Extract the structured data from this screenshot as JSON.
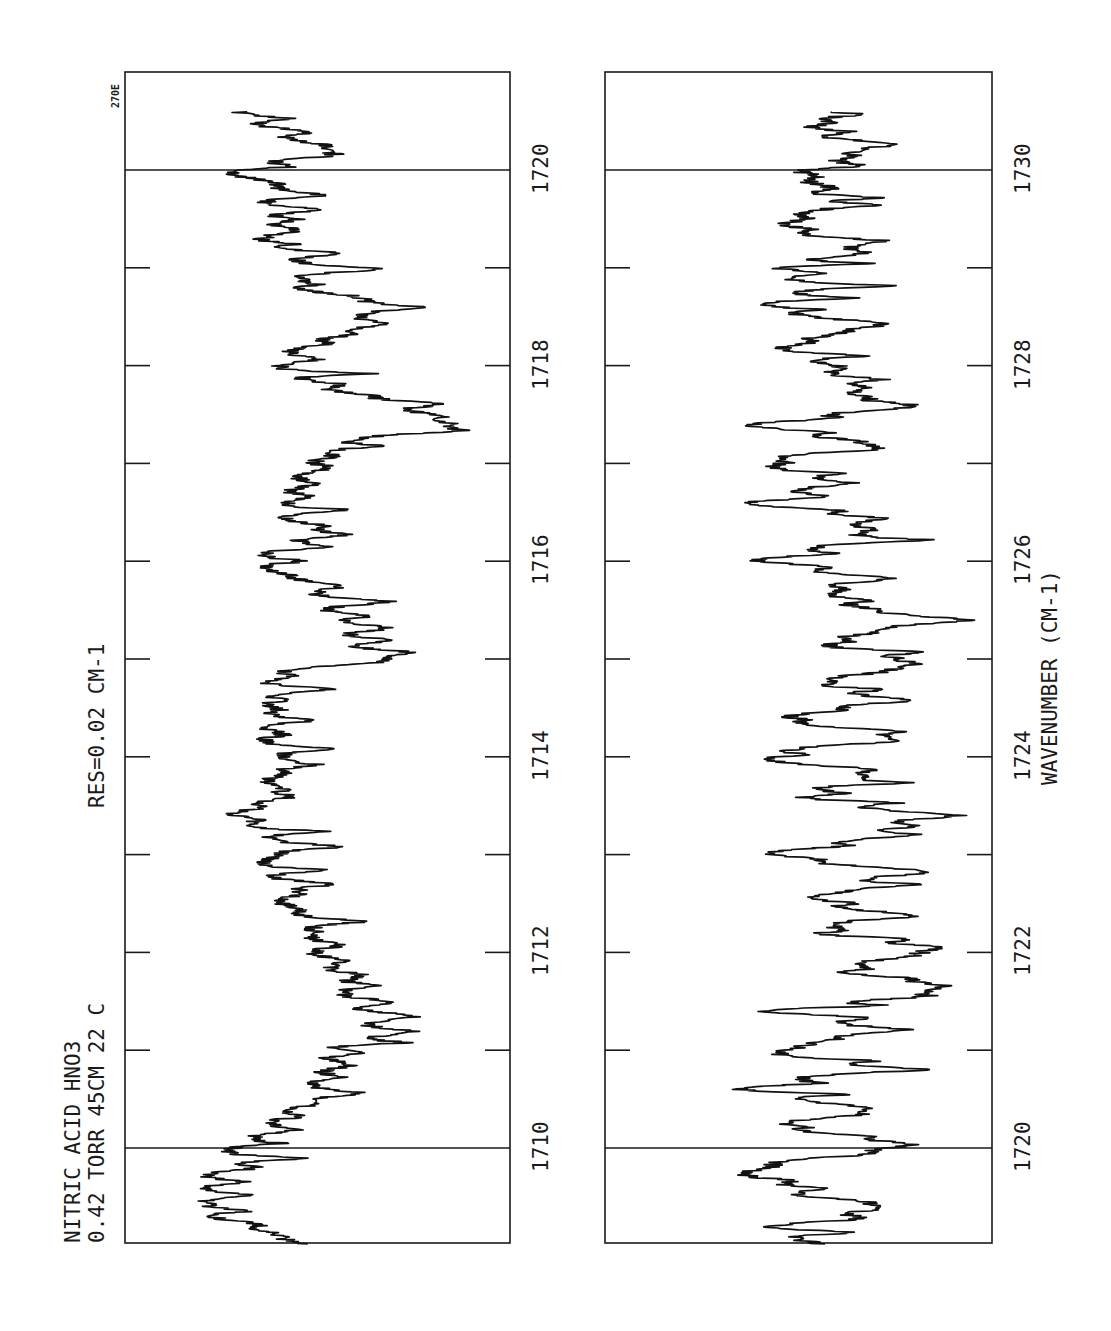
{
  "header": {
    "line1": "NITRIC ACID  HNO3",
    "line2": "0.42  TORR  45CM   22 C",
    "resolution": "RES=0.02 CM-1",
    "plate_code": "270E"
  },
  "colors": {
    "ink": "#111111",
    "paper": "#ffffff"
  },
  "chart_data": [
    {
      "type": "line",
      "title": "NITRIC ACID HNO3 — 0.42 TORR 45CM 22 C — RES=0.02 CM-1",
      "panel": "left",
      "orientation": "rotated 90° (wavenumber runs bottom-to-top, transmittance increases right-to-left)",
      "xlabel": "WAVENUMBER (CM-1)",
      "ylabel": "Transmittance (unlabeled)",
      "xlim": [
        1709.0,
        1720.95
      ],
      "ticks": [
        1710,
        1711,
        1712,
        1713,
        1714,
        1715,
        1716,
        1717,
        1718,
        1719,
        1720
      ],
      "tick_labels": [
        "1710",
        "1712",
        "1714",
        "1716",
        "1718",
        "1720"
      ],
      "label_positions": [
        1710,
        1712,
        1714,
        1716,
        1718,
        1720
      ],
      "reference_lines": [
        1710,
        1720
      ],
      "grid": false,
      "series": [
        {
          "name": "HNO3 spectrum 1709–1721 cm-1",
          "x": [
            1709.0,
            1709.2,
            1709.4,
            1709.6,
            1709.8,
            1710.0,
            1710.2,
            1710.4,
            1710.6,
            1710.8,
            1711.0,
            1711.2,
            1711.4,
            1711.6,
            1711.8,
            1712.0,
            1712.2,
            1712.4,
            1712.6,
            1712.8,
            1713.0,
            1713.2,
            1713.4,
            1713.6,
            1713.8,
            1714.0,
            1714.2,
            1714.4,
            1714.6,
            1714.8,
            1715.0,
            1715.2,
            1715.4,
            1715.6,
            1715.8,
            1716.0,
            1716.2,
            1716.4,
            1716.6,
            1716.8,
            1717.0,
            1717.2,
            1717.4,
            1717.6,
            1717.8,
            1718.0,
            1718.2,
            1718.4,
            1718.6,
            1718.8,
            1719.0,
            1719.2,
            1719.4,
            1719.6,
            1719.8,
            1720.0,
            1720.2,
            1720.4,
            1720.6
          ],
          "values": [
            0.8,
            0.84,
            0.82,
            0.83,
            0.8,
            0.78,
            0.7,
            0.64,
            0.6,
            0.58,
            0.56,
            0.48,
            0.52,
            0.5,
            0.55,
            0.58,
            0.62,
            0.66,
            0.7,
            0.72,
            0.74,
            0.7,
            0.76,
            0.72,
            0.7,
            0.66,
            0.74,
            0.7,
            0.72,
            0.76,
            0.5,
            0.62,
            0.6,
            0.58,
            0.66,
            0.76,
            0.7,
            0.64,
            0.62,
            0.66,
            0.64,
            0.55,
            0.2,
            0.42,
            0.6,
            0.66,
            0.62,
            0.58,
            0.4,
            0.64,
            0.58,
            0.7,
            0.74,
            0.76,
            0.66,
            0.8,
            0.62,
            0.7,
            0.72
          ],
          "note": "Approximate envelope of transmittance (1 = far left of frame, 0 = far right); strong absorption near 1717.4 and 1711.3"
        }
      ]
    },
    {
      "type": "line",
      "panel": "right",
      "orientation": "rotated 90° (wavenumber runs bottom-to-top, transmittance increases right-to-left)",
      "xlabel": "WAVENUMBER (CM-1)",
      "ylabel": "Transmittance (unlabeled)",
      "xlim": [
        1719.0,
        1730.95
      ],
      "ticks": [
        1720,
        1721,
        1722,
        1723,
        1724,
        1725,
        1726,
        1727,
        1728,
        1729,
        1730
      ],
      "tick_labels": [
        "1720",
        "1722",
        "1724",
        "1726",
        "1728",
        "1730"
      ],
      "label_positions": [
        1720,
        1722,
        1724,
        1726,
        1728,
        1730
      ],
      "reference_lines": [
        1720,
        1730
      ],
      "grid": false,
      "series": [
        {
          "name": "HNO3 spectrum 1719–1731 cm-1",
          "x": [
            1719.0,
            1719.2,
            1719.4,
            1719.6,
            1719.8,
            1720.0,
            1720.2,
            1720.4,
            1720.6,
            1720.8,
            1721.0,
            1721.2,
            1721.4,
            1721.6,
            1721.8,
            1722.0,
            1722.2,
            1722.4,
            1722.6,
            1722.8,
            1723.0,
            1723.2,
            1723.4,
            1723.6,
            1723.8,
            1724.0,
            1724.2,
            1724.4,
            1724.6,
            1724.8,
            1725.0,
            1725.2,
            1725.4,
            1725.6,
            1725.8,
            1726.0,
            1726.2,
            1726.4,
            1726.6,
            1726.8,
            1727.0,
            1727.2,
            1727.4,
            1727.6,
            1727.8,
            1728.0,
            1728.2,
            1728.4,
            1728.6,
            1728.8,
            1729.0,
            1729.2,
            1729.4,
            1729.6,
            1729.8,
            1730.0,
            1730.2,
            1730.4,
            1730.6
          ],
          "values": [
            0.62,
            0.72,
            0.42,
            0.74,
            0.7,
            0.44,
            0.7,
            0.44,
            0.72,
            0.42,
            0.68,
            0.42,
            0.74,
            0.42,
            0.72,
            0.44,
            0.7,
            0.4,
            0.72,
            0.44,
            0.7,
            0.4,
            0.36,
            0.7,
            0.42,
            0.68,
            0.42,
            0.7,
            0.44,
            0.66,
            0.42,
            0.7,
            0.42,
            0.66,
            0.48,
            0.72,
            0.44,
            0.42,
            0.7,
            0.46,
            0.68,
            0.48,
            0.7,
            0.48,
            0.66,
            0.5,
            0.68,
            0.52,
            0.66,
            0.52,
            0.72,
            0.54,
            0.66,
            0.56,
            0.64,
            0.68,
            0.5,
            0.6,
            0.58
          ],
          "note": "Regular series of sharp absorption lines spaced ~0.4 cm-1; approximate envelope (1 = far left of frame, 0 = far right)"
        }
      ]
    }
  ]
}
